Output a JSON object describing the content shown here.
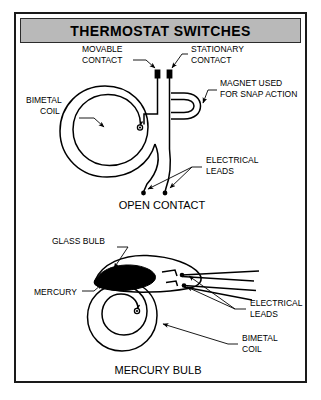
{
  "header": {
    "title": "THERMOSTAT SWITCHES"
  },
  "diagram": {
    "type": "technical-illustration",
    "panels": [
      {
        "id": "open-contact",
        "caption": "OPEN CONTACT",
        "labels": [
          "MOVABLE CONTACT",
          "STATIONARY CONTACT",
          "MAGNET USED FOR SNAP ACTION",
          "BIMETAL COIL",
          "ELECTRICAL LEADS"
        ]
      },
      {
        "id": "mercury-bulb",
        "caption": "MERCURY BULB",
        "labels": [
          "GLASS BULB",
          "MERCURY",
          "ELECTRICAL LEADS",
          "BIMETAL COIL"
        ]
      }
    ]
  },
  "labels": {
    "movable_contact_l1": "MOVABLE",
    "movable_contact_l2": "CONTACT",
    "stationary_contact_l1": "STATIONARY",
    "stationary_contact_l2": "CONTACT",
    "magnet_l1": "MAGNET USED",
    "magnet_l2": "FOR SNAP ACTION",
    "bimetal_coil_top_l1": "BIMETAL",
    "bimetal_coil_top_l2": "COIL",
    "electrical_leads_top_l1": "ELECTRICAL",
    "electrical_leads_top_l2": "LEADS",
    "open_contact_caption": "OPEN CONTACT",
    "glass_bulb": "GLASS BULB",
    "mercury": "MERCURY",
    "electrical_leads_bottom_l1": "ELECTRICAL",
    "electrical_leads_bottom_l2": "LEADS",
    "bimetal_coil_bottom_l1": "BIMETAL",
    "bimetal_coil_bottom_l2": "COIL",
    "mercury_bulb_caption": "MERCURY BULB"
  },
  "colors": {
    "ink": "#000000",
    "header_band": "#b9b9b9",
    "frame": "#1a1a1a",
    "page": "#ffffff",
    "mercury_fill": "#000000"
  }
}
